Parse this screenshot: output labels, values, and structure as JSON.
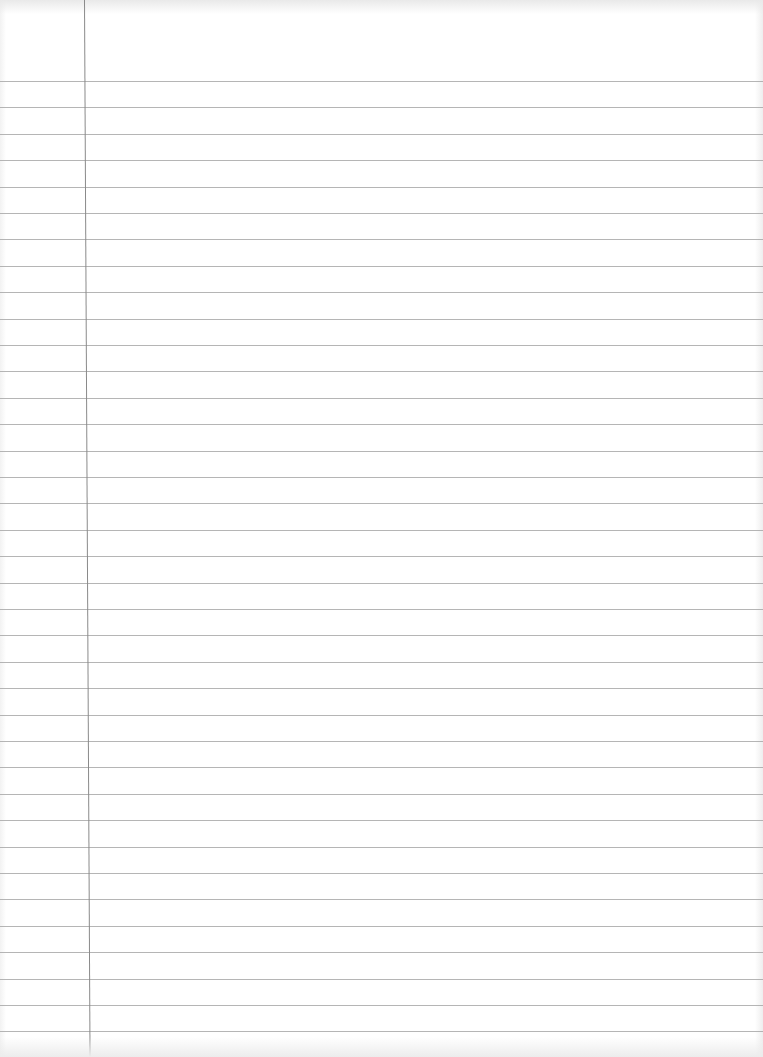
{
  "document": {
    "type": "lined-paper",
    "content": "",
    "line_count": 37,
    "first_line_y": 81,
    "line_spacing": 26.4,
    "margin_line_x": 84,
    "colors": {
      "paper": "#ffffff",
      "rule_line": "#a8a8a8",
      "margin_line": "#8a8a8a"
    }
  }
}
